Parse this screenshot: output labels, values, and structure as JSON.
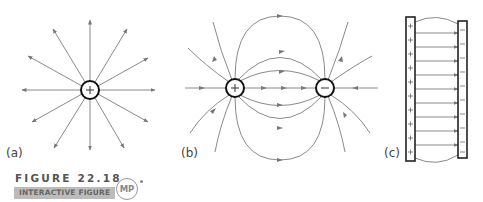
{
  "figure": {
    "title": "FIGURE 22.18",
    "banner": "INTERACTIVE FIGURE",
    "badge": "MP"
  },
  "panels": [
    {
      "label": "(a)",
      "description": "Field lines radiating outward from a single positive point charge",
      "charges": [
        "+"
      ]
    },
    {
      "label": "(b)",
      "description": "Field lines of an electric dipole from positive to negative charge",
      "charges": [
        "+",
        "−"
      ]
    },
    {
      "label": "(c)",
      "description": "Uniform field between parallel plates, positive left plate to negative right plate",
      "plate_left_sign": "+",
      "plate_right_sign": "−"
    }
  ],
  "colors": {
    "field_line": "#8a8a8a",
    "charge_outline": "#111111",
    "banner_bg": "#bcbcbc"
  }
}
